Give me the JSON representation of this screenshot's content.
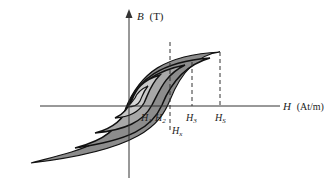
{
  "diagram": {
    "y_axis": {
      "label": "B",
      "unit": "(T)"
    },
    "x_axis": {
      "label": "H",
      "unit": "(At/m)"
    },
    "markers": [
      {
        "label": "H",
        "sub": "1"
      },
      {
        "label": "H",
        "sub": "2"
      },
      {
        "label": "H",
        "sub": "x"
      },
      {
        "label": "H",
        "sub": "3"
      },
      {
        "label": "H",
        "sub": "S"
      }
    ],
    "colors": {
      "outer_loop": "#8c8c8c",
      "middle_loop": "#a8a8a8",
      "inner_loop": "#c8c8c8",
      "stroke": "#111111",
      "axis": "#333333"
    }
  }
}
